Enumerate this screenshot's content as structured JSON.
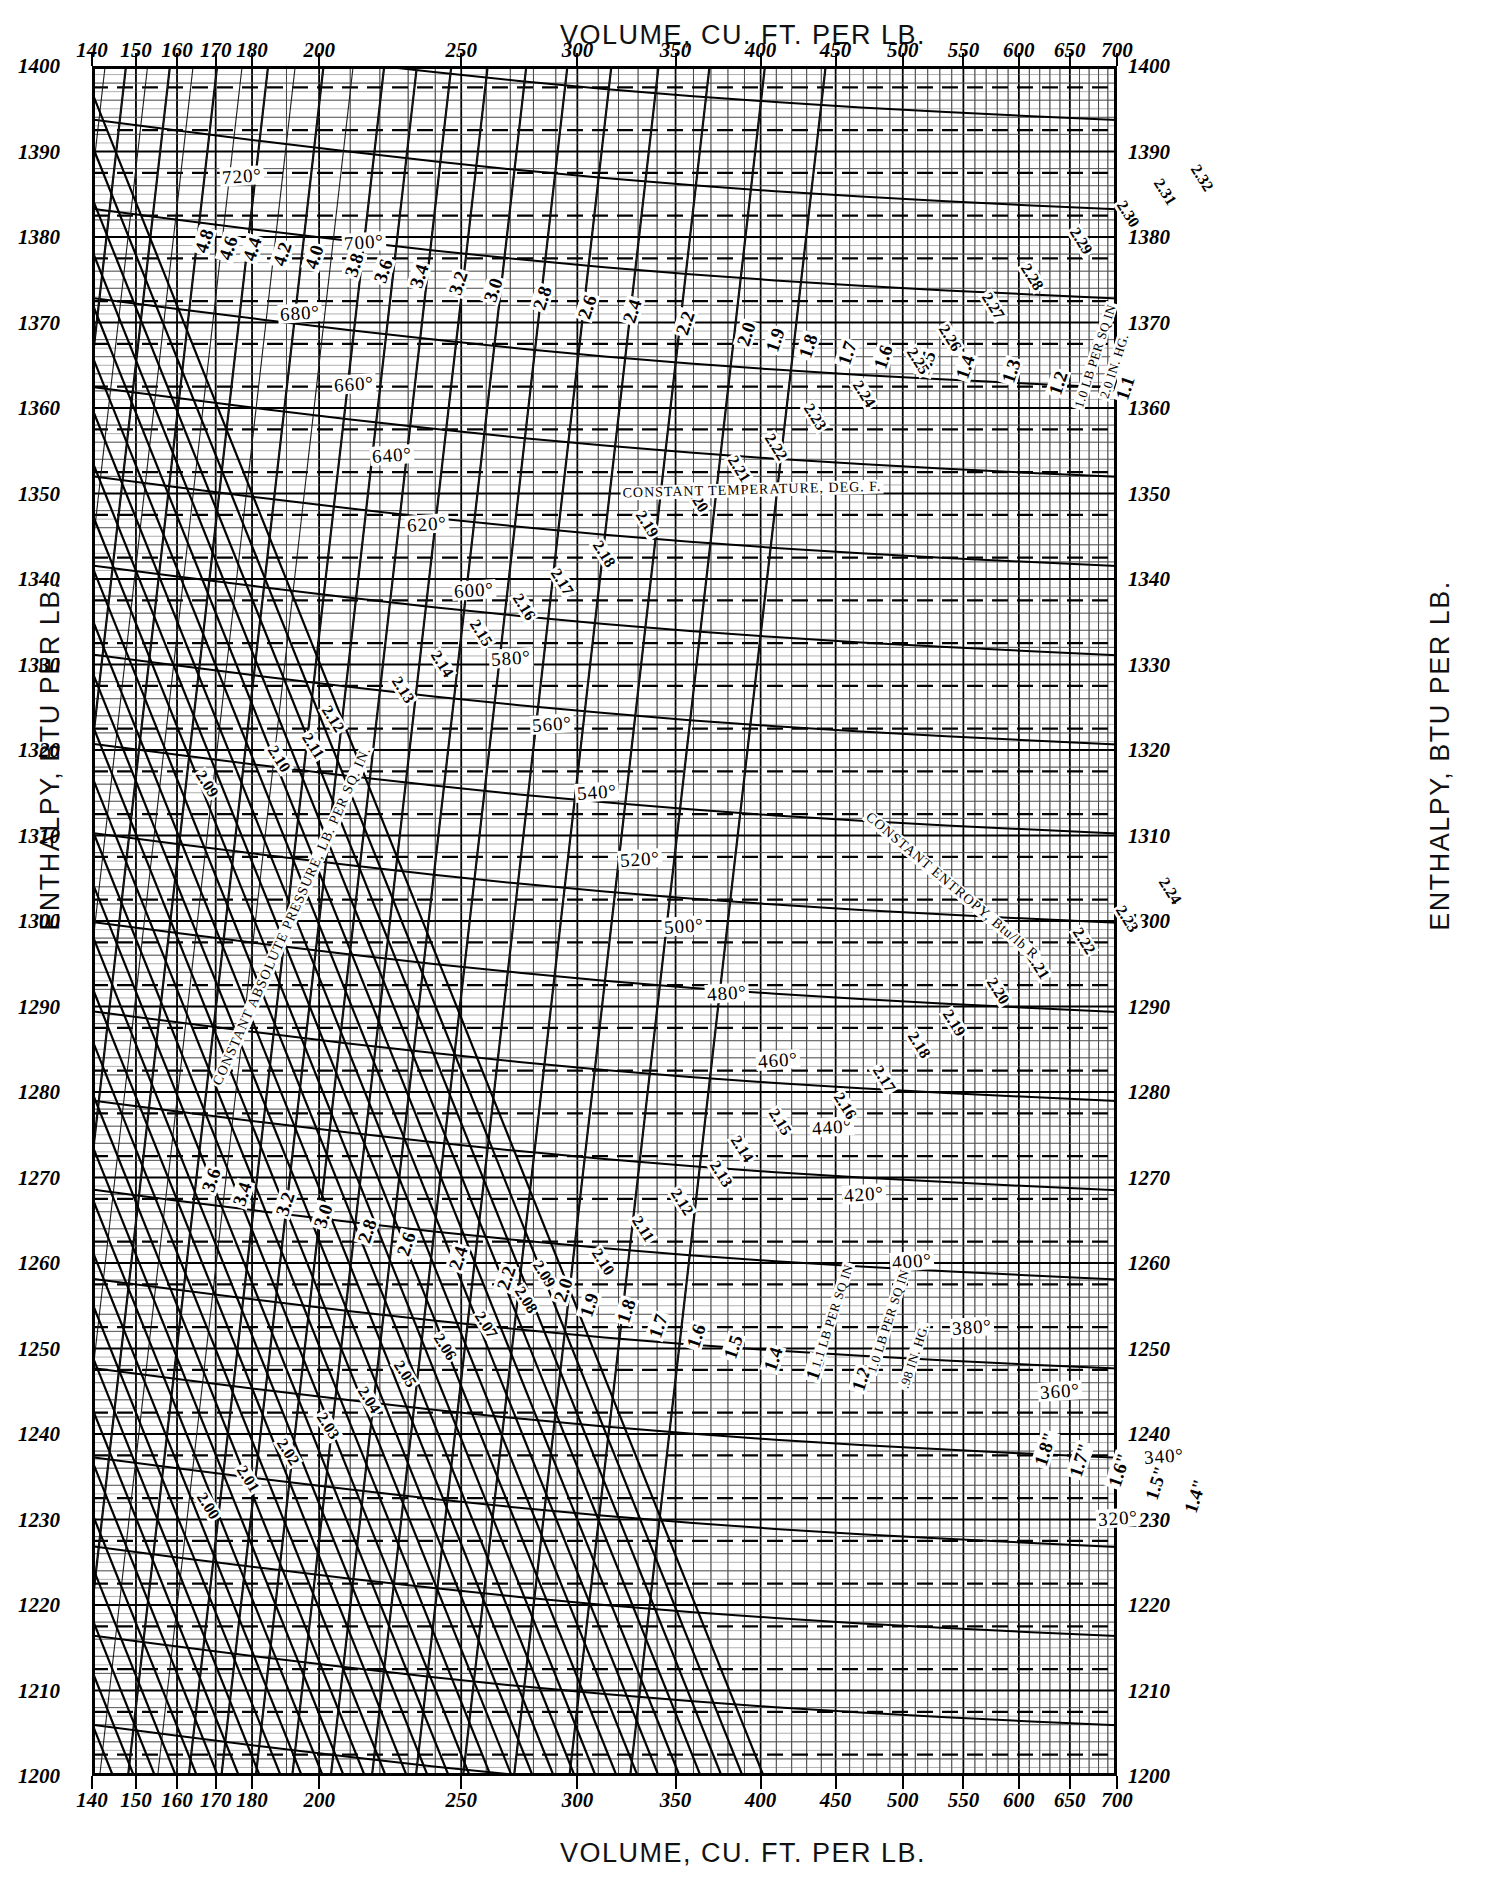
{
  "chart_data": {
    "type": "line",
    "xlabel": "VOLUME, CU. FT. PER LB.",
    "ylabel": "ENTHALPY, BTU PER LB.",
    "xscale": "log",
    "xlim": [
      140,
      700
    ],
    "ylim": [
      1200,
      1400
    ],
    "grid": true,
    "legend_position": "in-plot annotations",
    "x_ticks": [
      "140",
      "150",
      "160",
      "170",
      "180",
      "200",
      "250",
      "300",
      "350",
      "400",
      "450",
      "500",
      "550",
      "600",
      "650",
      "700"
    ],
    "x_tick_values": [
      140,
      150,
      160,
      170,
      180,
      200,
      250,
      300,
      350,
      400,
      450,
      500,
      550,
      600,
      650,
      700
    ],
    "y_ticks": [
      "1200",
      "1210",
      "1220",
      "1230",
      "1240",
      "1250",
      "1260",
      "1270",
      "1280",
      "1290",
      "1300",
      "1310",
      "1320",
      "1330",
      "1340",
      "1350",
      "1360",
      "1370",
      "1380",
      "1390",
      "1400"
    ],
    "y_tick_values": [
      1200,
      1210,
      1220,
      1230,
      1240,
      1250,
      1260,
      1270,
      1280,
      1290,
      1300,
      1310,
      1320,
      1330,
      1340,
      1350,
      1360,
      1370,
      1380,
      1390,
      1400
    ],
    "series": [
      {
        "name": "constant temperature, deg F",
        "kind": "isotherm",
        "values": [
          320,
          340,
          360,
          380,
          400,
          420,
          440,
          460,
          480,
          500,
          520,
          540,
          560,
          580,
          600,
          620,
          640,
          660,
          680,
          700,
          720
        ]
      },
      {
        "name": "constant absolute pressure, lb per sq in",
        "kind": "isobar",
        "values": [
          1.0,
          1.1,
          1.2,
          1.3,
          1.4,
          1.5,
          1.6,
          1.7,
          1.8,
          1.9,
          2.0,
          2.2,
          2.4,
          2.6,
          2.8,
          3.0,
          3.2,
          3.4,
          3.6,
          3.8,
          4.0,
          4.2,
          4.4,
          4.6,
          4.8
        ]
      },
      {
        "name": "constant entropy, Btu per lb R",
        "kind": "isentrope",
        "values": [
          2.0,
          2.01,
          2.02,
          2.03,
          2.04,
          2.05,
          2.06,
          2.07,
          2.08,
          2.09,
          2.1,
          2.11,
          2.12,
          2.13,
          2.14,
          2.15,
          2.16,
          2.17,
          2.18,
          2.19,
          2.2,
          2.21,
          2.22,
          2.23,
          2.24,
          2.25,
          2.26,
          2.27,
          2.28,
          2.29,
          2.3,
          2.31,
          2.32
        ]
      }
    ]
  },
  "top_axis": {
    "title": "VOLUME, CU. FT. PER LB.",
    "ticks": [
      "140",
      "150",
      "160",
      "170",
      "180",
      "200",
      "250",
      "300",
      "350",
      "400",
      "450",
      "500",
      "550",
      "600",
      "650",
      "700"
    ]
  },
  "bottom_axis": {
    "title": "VOLUME, CU. FT. PER LB.",
    "ticks": [
      "140",
      "150",
      "160",
      "170",
      "180",
      "200",
      "250",
      "300",
      "350",
      "400",
      "450",
      "500",
      "550",
      "600",
      "650",
      "700"
    ]
  },
  "left_axis": {
    "title": "ENTHALPY, BTU PER LB.",
    "ticks": [
      "1400",
      "1390",
      "1380",
      "1370",
      "1360",
      "1350",
      "1340",
      "1330",
      "1320",
      "1310",
      "1300",
      "1290",
      "1280",
      "1270",
      "1260",
      "1250",
      "1240",
      "1230",
      "1220",
      "1210",
      "1200"
    ]
  },
  "right_axis": {
    "title": "ENTHALPY, BTU PER LB.",
    "ticks": [
      "1400",
      "1390",
      "1380",
      "1370",
      "1360",
      "1350",
      "1340",
      "1330",
      "1320",
      "1310",
      "1300",
      "1290",
      "1280",
      "1270",
      "1260",
      "1250",
      "1240",
      "1230",
      "1220",
      "1210",
      "1200"
    ]
  },
  "legends": {
    "temperature": "CONSTANT TEMPERATURE, DEG. F.",
    "pressure": "CONSTANT ABSOLUTE PRESSURE, LB. PER SQ. IN.",
    "entropy": "CONSTANT ENTROPY, Btu/lb R"
  },
  "unit_notes": [
    "1.0 LB PER SQ IN",
    "2.0 IN. HG.",
    "1.1 LB PER SQ IN",
    "1.0 LB PER SQ IN",
    ".98 IN. HG."
  ],
  "temp_labels": [
    {
      "t": "720°",
      "x": 150,
      "y": 110
    },
    {
      "t": "700°",
      "x": 272,
      "y": 176
    },
    {
      "t": "680°",
      "x": 208,
      "y": 247
    },
    {
      "t": "660°",
      "x": 262,
      "y": 318
    },
    {
      "t": "640°",
      "x": 300,
      "y": 389
    },
    {
      "t": "620°",
      "x": 335,
      "y": 458
    },
    {
      "t": "600°",
      "x": 382,
      "y": 524
    },
    {
      "t": "580°",
      "x": 419,
      "y": 592
    },
    {
      "t": "560°",
      "x": 460,
      "y": 658
    },
    {
      "t": "540°",
      "x": 505,
      "y": 726
    },
    {
      "t": "520°",
      "x": 548,
      "y": 793
    },
    {
      "t": "500°",
      "x": 592,
      "y": 860
    },
    {
      "t": "480°",
      "x": 635,
      "y": 927
    },
    {
      "t": "460°",
      "x": 686,
      "y": 994
    },
    {
      "t": "440°",
      "x": 740,
      "y": 1061
    },
    {
      "t": "420°",
      "x": 772,
      "y": 1128
    },
    {
      "t": "400°",
      "x": 820,
      "y": 1195
    },
    {
      "t": "380°",
      "x": 880,
      "y": 1261
    },
    {
      "t": "360°",
      "x": 968,
      "y": 1325
    },
    {
      "t": "340°",
      "x": 1072,
      "y": 1390
    },
    {
      "t": "320°",
      "x": 1026,
      "y": 1452
    }
  ],
  "pressure_labels_top": [
    {
      "t": "4.8",
      "x": 112,
      "y": 175
    },
    {
      "t": "4.6",
      "x": 136,
      "y": 182
    },
    {
      "t": "4.4",
      "x": 160,
      "y": 183
    },
    {
      "t": "4.2",
      "x": 190,
      "y": 188
    },
    {
      "t": "4.0",
      "x": 222,
      "y": 191
    },
    {
      "t": "3.8",
      "x": 262,
      "y": 199
    },
    {
      "t": "3.6",
      "x": 291,
      "y": 205
    },
    {
      "t": "3.4",
      "x": 327,
      "y": 210
    },
    {
      "t": "3.2",
      "x": 366,
      "y": 217
    },
    {
      "t": "3.0",
      "x": 401,
      "y": 224
    },
    {
      "t": "2.8",
      "x": 450,
      "y": 232
    },
    {
      "t": "2.6",
      "x": 495,
      "y": 241
    },
    {
      "t": "2.4",
      "x": 540,
      "y": 245
    },
    {
      "t": "2.2",
      "x": 593,
      "y": 257
    },
    {
      "t": "2.0",
      "x": 654,
      "y": 268
    },
    {
      "t": "1.9",
      "x": 683,
      "y": 274
    },
    {
      "t": "1.8",
      "x": 716,
      "y": 280
    },
    {
      "t": "1.7",
      "x": 755,
      "y": 287
    },
    {
      "t": "1.6",
      "x": 791,
      "y": 291
    },
    {
      "t": "1.5",
      "x": 834,
      "y": 297
    },
    {
      "t": "1.4",
      "x": 873,
      "y": 301
    },
    {
      "t": "1.3",
      "x": 919,
      "y": 305
    },
    {
      "t": "1.2",
      "x": 966,
      "y": 317
    },
    {
      "t": "1.1",
      "x": 1033,
      "y": 322
    }
  ],
  "pressure_labels_bottom": [
    {
      "t": "3.6",
      "x": 119,
      "y": 1114
    },
    {
      "t": "3.4",
      "x": 150,
      "y": 1128
    },
    {
      "t": "3.2",
      "x": 193,
      "y": 1138
    },
    {
      "t": "3.0",
      "x": 231,
      "y": 1150
    },
    {
      "t": "2.8",
      "x": 275,
      "y": 1165
    },
    {
      "t": "2.6",
      "x": 314,
      "y": 1178
    },
    {
      "t": "2.4",
      "x": 366,
      "y": 1192
    },
    {
      "t": "2.2",
      "x": 414,
      "y": 1212
    },
    {
      "t": "2.0",
      "x": 471,
      "y": 1224
    },
    {
      "t": "1.9",
      "x": 497,
      "y": 1239
    },
    {
      "t": "1.8",
      "x": 534,
      "y": 1245
    },
    {
      "t": "1.7",
      "x": 566,
      "y": 1260
    },
    {
      "t": "1.6",
      "x": 604,
      "y": 1270
    },
    {
      "t": "1.5",
      "x": 641,
      "y": 1281
    },
    {
      "t": "1.4",
      "x": 681,
      "y": 1293
    },
    {
      "t": "1.3",
      "x": 723,
      "y": 1302
    },
    {
      "t": "1.2",
      "x": 769,
      "y": 1313
    },
    {
      "t": "1.8\"",
      "x": 953,
      "y": 1383
    },
    {
      "t": "1.7\"",
      "x": 988,
      "y": 1394
    },
    {
      "t": "1.6\"",
      "x": 1027,
      "y": 1404
    },
    {
      "t": "1.5\"",
      "x": 1064,
      "y": 1417
    },
    {
      "t": "1.4\"",
      "x": 1103,
      "y": 1430
    }
  ],
  "entropy_labels": [
    {
      "t": "2.32",
      "x": 1110,
      "y": 112
    },
    {
      "t": "2.31",
      "x": 1073,
      "y": 126
    },
    {
      "t": "2.30",
      "x": 1036,
      "y": 148
    },
    {
      "t": "2.29",
      "x": 989,
      "y": 175
    },
    {
      "t": "2.28",
      "x": 940,
      "y": 211
    },
    {
      "t": "2.27",
      "x": 901,
      "y": 240
    },
    {
      "t": "2.26",
      "x": 858,
      "y": 272
    },
    {
      "t": "2.25",
      "x": 826,
      "y": 295
    },
    {
      "t": "2.24",
      "x": 772,
      "y": 328
    },
    {
      "t": "2.23",
      "x": 723,
      "y": 351
    },
    {
      "t": "2.22",
      "x": 684,
      "y": 381
    },
    {
      "t": "2.21",
      "x": 647,
      "y": 403
    },
    {
      "t": "2.20",
      "x": 605,
      "y": 433
    },
    {
      "t": "2.19",
      "x": 555,
      "y": 458
    },
    {
      "t": "2.18",
      "x": 512,
      "y": 488
    },
    {
      "t": "2.17",
      "x": 470,
      "y": 516
    },
    {
      "t": "2.16",
      "x": 432,
      "y": 541
    },
    {
      "t": "2.15",
      "x": 389,
      "y": 567
    },
    {
      "t": "2.14",
      "x": 350,
      "y": 598
    },
    {
      "t": "2.13",
      "x": 311,
      "y": 624
    },
    {
      "t": "2.12",
      "x": 241,
      "y": 653
    },
    {
      "t": "2.11",
      "x": 221,
      "y": 680
    },
    {
      "t": "2.10",
      "x": 187,
      "y": 693
    },
    {
      "t": "2.09",
      "x": 115,
      "y": 718
    },
    {
      "t": "2.24",
      "x": 1078,
      "y": 825
    },
    {
      "t": "2.23",
      "x": 1035,
      "y": 853
    },
    {
      "t": "2.22",
      "x": 992,
      "y": 875
    },
    {
      "t": "2.21",
      "x": 946,
      "y": 900
    },
    {
      "t": "2.20",
      "x": 906,
      "y": 925
    },
    {
      "t": "2.19",
      "x": 862,
      "y": 957
    },
    {
      "t": "2.18",
      "x": 827,
      "y": 979
    },
    {
      "t": "2.17",
      "x": 792,
      "y": 1013
    },
    {
      "t": "2.16",
      "x": 753,
      "y": 1040
    },
    {
      "t": "2.15",
      "x": 688,
      "y": 1056
    },
    {
      "t": "2.14",
      "x": 650,
      "y": 1083
    },
    {
      "t": "2.13",
      "x": 629,
      "y": 1108
    },
    {
      "t": "2.12",
      "x": 590,
      "y": 1136
    },
    {
      "t": "2.11",
      "x": 551,
      "y": 1163
    },
    {
      "t": "2.10",
      "x": 511,
      "y": 1196
    },
    {
      "t": "2.09",
      "x": 452,
      "y": 1208
    },
    {
      "t": "2.08",
      "x": 434,
      "y": 1234
    },
    {
      "t": "2.07",
      "x": 394,
      "y": 1259
    },
    {
      "t": "2.06",
      "x": 353,
      "y": 1281
    },
    {
      "t": "2.05",
      "x": 313,
      "y": 1308
    },
    {
      "t": "2.04",
      "x": 277,
      "y": 1334
    },
    {
      "t": "2.03",
      "x": 236,
      "y": 1360
    },
    {
      "t": "2.02",
      "x": 196,
      "y": 1386
    },
    {
      "t": "2.01",
      "x": 156,
      "y": 1413
    },
    {
      "t": "2.00",
      "x": 116,
      "y": 1440
    }
  ]
}
